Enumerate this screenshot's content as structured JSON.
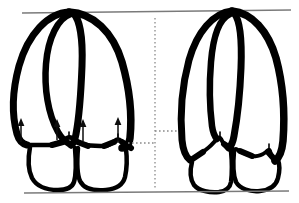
{
  "figure": {
    "background_color": "#ffffff",
    "outline_color": "#000000",
    "reference_line_color": "#7a7a7a",
    "guide_line_color": "#8a8a8a",
    "arrow_color": "#0d0d0d",
    "width": 299,
    "height": 203
  },
  "reference_lines": {
    "top": {
      "name": "upper-reference-line",
      "x1": 22,
      "y1": 13,
      "x2": 291,
      "y2": 10
    },
    "bottom": {
      "name": "lower-reference-line",
      "x1": 24,
      "y1": 193,
      "x2": 289,
      "y2": 191
    }
  },
  "divider": {
    "name": "center-dotted-divider",
    "x": 155,
    "y_top": 18,
    "y_bottom": 188
  },
  "guides": [
    {
      "name": "left-specimen-level-guide",
      "x1": 128,
      "y1": 143,
      "x2": 155,
      "y2": 143
    },
    {
      "name": "right-specimen-level-guide",
      "x1": 155,
      "y1": 131,
      "x2": 180,
      "y2": 131
    }
  ],
  "specimens": [
    {
      "id": "left",
      "name": "left-specimen",
      "label": "",
      "has_arrows": true,
      "arrow_count": 4,
      "description": "Hoof with elevated sole horn, upward displacement arrows shown"
    },
    {
      "id": "right",
      "name": "right-specimen",
      "label": "",
      "has_arrows": false,
      "arrow_count": 0,
      "description": "Hoof with lower sole horn junction, no displacement arrows"
    }
  ],
  "arrows": [
    {
      "name": "arrow-1",
      "x": 21,
      "y_tail": 142,
      "y_head": 120
    },
    {
      "name": "arrow-2",
      "x": 57,
      "y_tail": 140,
      "y_head": 121
    },
    {
      "name": "arrow-3",
      "x": 83,
      "y_tail": 141,
      "y_head": 121
    },
    {
      "name": "arrow-4",
      "x": 118,
      "y_tail": 143,
      "y_head": 119
    }
  ]
}
